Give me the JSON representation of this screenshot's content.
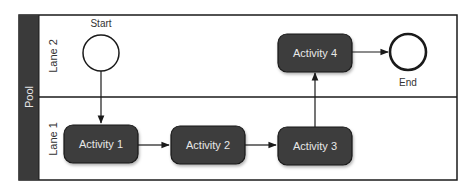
{
  "diagram": {
    "pool": {
      "label": "Pool"
    },
    "lanes": [
      {
        "label": "Lane 2"
      },
      {
        "label": "Lane 1"
      }
    ],
    "events": {
      "start": {
        "label": "Start"
      },
      "end": {
        "label": "End"
      }
    },
    "activities": [
      {
        "label": "Activity 1"
      },
      {
        "label": "Activity 2"
      },
      {
        "label": "Activity 3"
      },
      {
        "label": "Activity 4"
      }
    ],
    "colors": {
      "activity_fill": "#3d3d3d",
      "pool_band": "#3a3a3a",
      "stroke": "#1a1a1a",
      "text_light": "#e8e8e8",
      "text_dark": "#333333"
    }
  }
}
